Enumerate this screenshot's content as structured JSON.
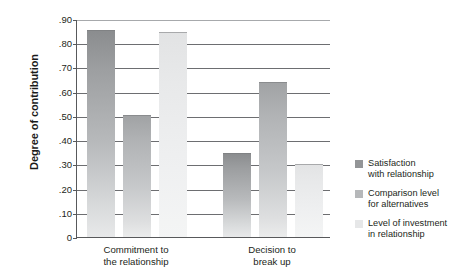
{
  "chart_data": {
    "type": "bar",
    "title": "",
    "xlabel": "",
    "ylabel": "Degree of contribution",
    "ylim": [
      0,
      0.9
    ],
    "ytick_labels": [
      ".90",
      ".80",
      ".70",
      ".60",
      ".50",
      ".40",
      ".30",
      ".20",
      ".10",
      "0"
    ],
    "ytick_values": [
      0.9,
      0.8,
      0.7,
      0.6,
      0.5,
      0.4,
      0.3,
      0.2,
      0.1,
      0
    ],
    "grid": "horizontal",
    "legend_position": "right",
    "categories": [
      "Commitment to the relationship",
      "Decision to break up"
    ],
    "category_lines": [
      [
        "Commitment to",
        "the relationship"
      ],
      [
        "Decision to",
        "break up"
      ]
    ],
    "series": [
      {
        "name": "Satisfaction with relationship",
        "name_lines": [
          "Satisfaction",
          "with relationship"
        ],
        "color": "#939597",
        "values": [
          0.855,
          0.345
        ]
      },
      {
        "name": "Comparison level for alternatives",
        "name_lines": [
          "Comparison level",
          "for alternatives"
        ],
        "color": "#b6b8ba",
        "values": [
          0.505,
          0.64
        ]
      },
      {
        "name": "Level of investment in relationship",
        "name_lines": [
          "Level of investment",
          "in relationship"
        ],
        "color": "#e6e7e8",
        "values": [
          0.848,
          0.3
        ]
      }
    ]
  },
  "colors": {
    "axis": "#58595b",
    "gridline": "#6d6e71",
    "text": "#231f20",
    "background": "#ffffff"
  }
}
